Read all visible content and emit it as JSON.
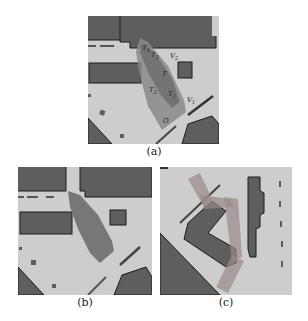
{
  "figure": {
    "panels": [
      {
        "id": "a",
        "caption": "(a)",
        "labels": {
          "T4": "T",
          "T3": "T",
          "V2": "V",
          "T": "T",
          "T2": "T",
          "T1": "T",
          "V1": "V",
          "O": "O"
        },
        "subscripts": {
          "T4": "4",
          "T3": "3",
          "V2": "2",
          "T2": "2",
          "T1": "1",
          "V1": "1"
        }
      },
      {
        "id": "b",
        "caption": "(b)"
      },
      {
        "id": "c",
        "caption": "(c)"
      }
    ],
    "colors": {
      "free_space": "#cdcdcd",
      "obstacle": "#5e5e5e",
      "outline": "#1a1a1a",
      "region": "#7a7a7a"
    }
  }
}
